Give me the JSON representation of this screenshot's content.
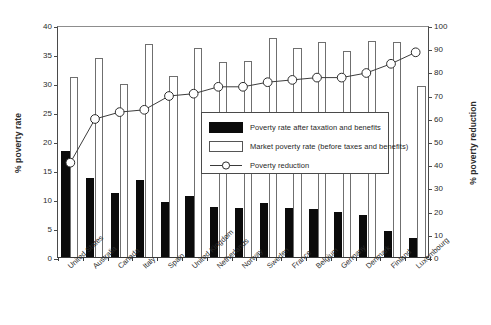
{
  "chart_data": {
    "type": "bar",
    "title": "",
    "xlabel": "",
    "ylabel": "% poverty rate",
    "y2label": "% poverty reduction",
    "ylim": [
      0,
      40
    ],
    "y2lim": [
      0,
      100
    ],
    "yticks": [
      0,
      5,
      10,
      15,
      20,
      25,
      30,
      35,
      40
    ],
    "y2ticks": [
      0,
      10,
      20,
      30,
      40,
      50,
      60,
      70,
      80,
      90,
      100
    ],
    "grid": false,
    "legend_position": "center",
    "categories": [
      "United States",
      "Australia",
      "Canada",
      "Italy",
      "Spain",
      "United Kingdom",
      "Netherlands",
      "Norway",
      "Sweden",
      "France",
      "Belgium",
      "Germany",
      "Denmark",
      "Finland",
      "Luxembourg"
    ],
    "series": [
      {
        "name": "Poverty rate after taxation and benefits",
        "type": "bar",
        "axis": "left",
        "color": "#0b0b0b",
        "values": [
          18.2,
          13.7,
          11.1,
          13.3,
          9.5,
          10.6,
          8.7,
          8.5,
          9.3,
          8.5,
          8.3,
          7.7,
          7.3,
          4.5,
          3.3
        ]
      },
      {
        "name": "Market poverty rate (before taxes and benefits)",
        "type": "bar",
        "axis": "left",
        "color": "#ffffff",
        "values": [
          31.1,
          34.3,
          29.8,
          36.8,
          31.2,
          36.1,
          33.7,
          33.8,
          37.8,
          36.0,
          37.0,
          35.5,
          37.2,
          37.0,
          29.5
        ]
      },
      {
        "name": "Poverty reduction",
        "type": "line",
        "axis": "right",
        "marker": "open-circle",
        "values": [
          41,
          60,
          63,
          64,
          70,
          71,
          74,
          74,
          76,
          77,
          78,
          78,
          80,
          84,
          89
        ]
      }
    ]
  },
  "legend": {
    "items": [
      {
        "key": "black-swatch",
        "label": "Poverty rate after taxation and benefits"
      },
      {
        "key": "white-swatch",
        "label": "Market poverty rate (before taxes and benefits)"
      },
      {
        "key": "circle-line",
        "label": "Poverty reduction"
      }
    ]
  }
}
